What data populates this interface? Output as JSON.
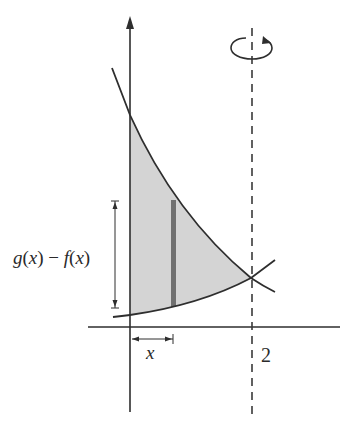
{
  "diagram": {
    "type": "solid-of-revolution-shell-method",
    "labels": {
      "height_label_g": "g",
      "height_label_open1": "(",
      "height_label_x1": "x",
      "height_label_close1": ")",
      "height_label_minus": " − ",
      "height_label_f": "f",
      "height_label_open2": "(",
      "height_label_x2": "x",
      "height_label_close2": ")",
      "radius_label": "x",
      "axis_tick_label": "2"
    },
    "axis_of_rotation": {
      "x_value": 2,
      "style": "dashed",
      "rotation_indicator": "counterclockwise-ellipse"
    },
    "curves": [
      {
        "name": "g(x)",
        "description": "upper decreasing curve"
      },
      {
        "name": "f(x)",
        "description": "lower increasing curve"
      }
    ],
    "region": {
      "from_x": 0,
      "to_x": 2,
      "fill": "#d4d4d4"
    },
    "strip": {
      "position": "x",
      "fill": "#707070"
    },
    "colors": {
      "stroke": "#2e2e2e",
      "region_fill": "#d4d4d4",
      "strip_fill": "#707070",
      "background": "#ffffff"
    }
  }
}
